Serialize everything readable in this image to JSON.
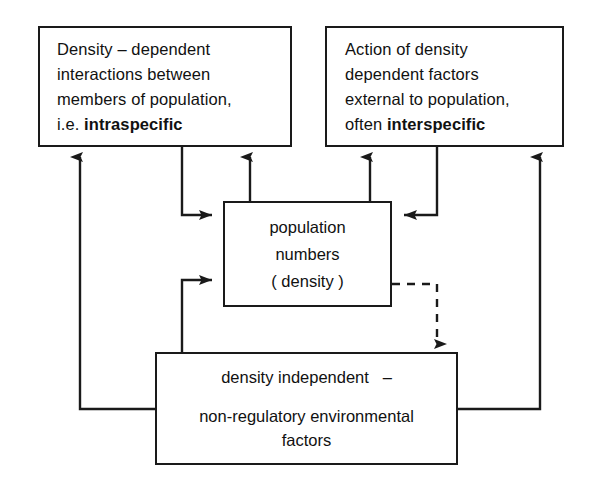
{
  "diagram": {
    "type": "flow-diagram",
    "background_color": "#ffffff",
    "stroke_color": "#1a1a1a",
    "text_color": "#111111"
  },
  "boxes": {
    "top_left": {
      "name": "density-dependent-intraspecific",
      "line1": "Density – dependent",
      "line2": "interactions between",
      "line3": "members of population,",
      "line4_prefix": "i.e. ",
      "line4_bold": "intraspecific"
    },
    "top_right": {
      "name": "density-dependent-external-interspecific",
      "line1": "Action of density",
      "line2": "dependent factors",
      "line3": "external to population,",
      "line4_prefix": "often ",
      "line4_bold": "interspecific"
    },
    "center": {
      "name": "population-numbers",
      "line1": "population",
      "line2": "numbers",
      "line3": "( density )"
    },
    "bottom": {
      "name": "density-independent-factors",
      "line1": "density independent   –",
      "line2": "non-regulatory environmental\nfactors"
    }
  },
  "connectors": [
    {
      "id": "center-to-top-left",
      "label": "population numbers to density-dependent intraspecific interactions",
      "style": "solid",
      "arrowhead": "up"
    },
    {
      "id": "top-left-to-center",
      "label": "density-dependent intraspecific interactions to population numbers",
      "style": "solid",
      "arrowhead": "right"
    },
    {
      "id": "center-to-top-right",
      "label": "population numbers to density-dependent external factors",
      "style": "solid",
      "arrowhead": "up"
    },
    {
      "id": "top-right-to-center",
      "label": "density-dependent external factors to population numbers",
      "style": "solid",
      "arrowhead": "left"
    },
    {
      "id": "bottom-to-center",
      "label": "density independent factors to population numbers",
      "style": "solid",
      "arrowhead": "right"
    },
    {
      "id": "bottom-to-top-left",
      "label": "density independent factors to intraspecific interactions",
      "style": "solid",
      "arrowhead": "up"
    },
    {
      "id": "bottom-to-top-right",
      "label": "density independent factors to external density dependent factors",
      "style": "solid",
      "arrowhead": "up"
    },
    {
      "id": "center-to-bottom-dashed",
      "label": "population numbers to density independent factors (no effect)",
      "style": "dashed",
      "arrowhead": "down"
    }
  ]
}
